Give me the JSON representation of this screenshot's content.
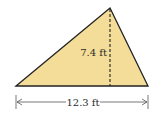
{
  "figure": {
    "shape": "triangle",
    "fill_color": "#f3dd98",
    "stroke_color": "#222222",
    "height_label": "7.4 ft",
    "base_label": "12.3 ft"
  }
}
